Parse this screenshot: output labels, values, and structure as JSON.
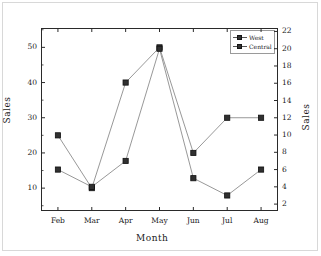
{
  "chart_data": {
    "type": "line",
    "title": "",
    "xlabel": "Month",
    "ylabel": "Sales",
    "ylabel_right": "Sales",
    "categories": [
      "Feb",
      "Mar",
      "Apr",
      "May",
      "Jun",
      "Jul",
      "Aug"
    ],
    "grid": false,
    "legend_position": "top-right",
    "series": [
      {
        "name": "West",
        "axis": "left",
        "values": [
          25,
          10,
          40,
          50,
          20,
          30,
          30
        ],
        "marker": "square",
        "color": "#303030"
      },
      {
        "name": "Central",
        "axis": "right",
        "values": [
          6,
          4,
          7,
          20,
          5,
          3,
          6
        ],
        "marker": "square",
        "color": "#303030"
      }
    ],
    "yaxis_left": {
      "label": "Sales",
      "ticks": [
        10,
        20,
        30,
        40,
        50
      ],
      "minor_ticks": [
        5,
        15,
        25,
        35,
        45,
        55
      ],
      "ylim": [
        3.5,
        55.5
      ]
    },
    "yaxis_right": {
      "label": "Sales",
      "ticks": [
        2,
        4,
        6,
        8,
        10,
        12,
        14,
        16,
        18,
        20,
        22
      ],
      "ylim": [
        1.2,
        22.4
      ]
    },
    "xaxis": {
      "label": "Month",
      "ticks": [
        "Feb",
        "Mar",
        "Apr",
        "May",
        "Jun",
        "Jul",
        "Aug"
      ]
    },
    "legend": {
      "entries": [
        "West",
        "Central"
      ]
    }
  }
}
